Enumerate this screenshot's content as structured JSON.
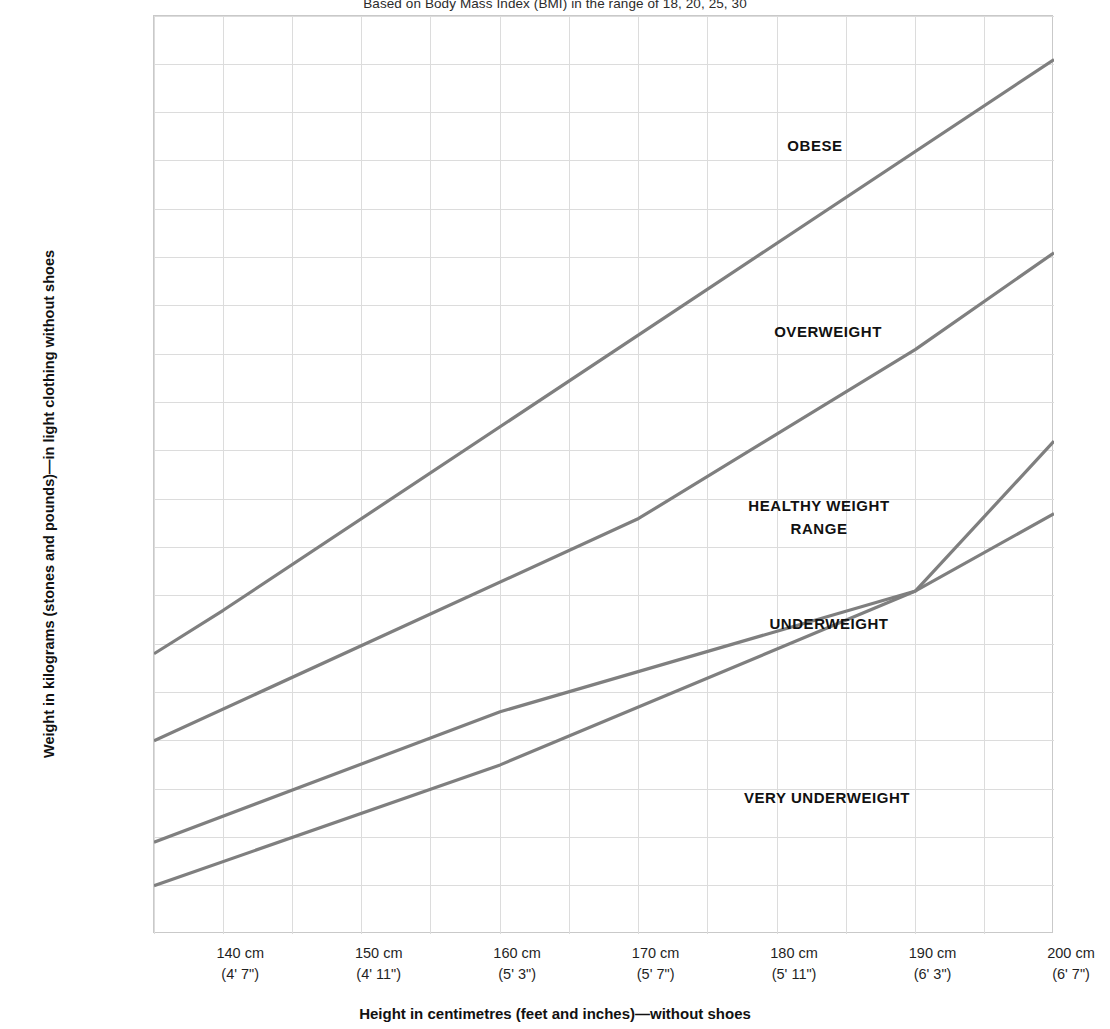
{
  "chart_data": {
    "type": "line",
    "title": "Based on Body Mass Index (BMI) in the range of 18, 20, 25, 30",
    "xlabel": "Height in centimetres (feet and inches)—without shoes",
    "ylabel": "Weight in kilograms (stones and pounds)—in light clothing without shoes",
    "xlim": [
      135,
      200
    ],
    "ylim": [
      30,
      125
    ],
    "grid": true,
    "legend_position": "inline-zone-labels",
    "x_unit": "cm",
    "y_unit": "kg",
    "y_secondary_unit": "st/lb",
    "x_ticks": [
      {
        "cm": "140 cm",
        "ft": "(4' 7\")",
        "value": 140
      },
      {
        "cm": "150 cm",
        "ft": "(4' 11\")",
        "value": 150
      },
      {
        "cm": "160 cm",
        "ft": "(5' 3\")",
        "value": 160
      },
      {
        "cm": "170 cm",
        "ft": "(5' 7\")",
        "value": 170
      },
      {
        "cm": "180 cm",
        "ft": "(5' 11\")",
        "value": 180
      },
      {
        "cm": "190 cm",
        "ft": "(6' 3\")",
        "value": 190
      },
      {
        "cm": "200 cm",
        "ft": "(6' 7\")",
        "value": 200
      }
    ],
    "x_minor_gridlines": [
      135,
      140,
      145,
      150,
      155,
      160,
      165,
      170,
      175,
      180,
      185,
      190,
      195,
      200
    ],
    "y_ticks": [
      {
        "kg": "120",
        "st": "(18.12)",
        "value": 120
      },
      {
        "kg": "110",
        "st": "(17.4)",
        "value": 110
      },
      {
        "kg": "100",
        "st": "(15.10)",
        "value": 100
      },
      {
        "kg": "90",
        "st": "(14.2)",
        "value": 90
      },
      {
        "kg": "80",
        "st": "(12.8)",
        "value": 80
      },
      {
        "kg": "70",
        "st": "(11.0)",
        "value": 70
      },
      {
        "kg": "60",
        "st": "(9.6)",
        "value": 60
      },
      {
        "kg": "50",
        "st": "(7.12)",
        "value": 50
      },
      {
        "kg": "40",
        "st": "(6.4)",
        "value": 40
      },
      {
        "kg": "30",
        "st": "(4.10)",
        "value": 30
      }
    ],
    "y_minor_gridlines": [
      30,
      35,
      40,
      45,
      50,
      55,
      60,
      65,
      70,
      75,
      80,
      85,
      90,
      95,
      100,
      105,
      110,
      115,
      120,
      125
    ],
    "y_axis_corner_labels": {
      "left": "(st/lb)",
      "right": "kg"
    },
    "line_color": "#7f7f7f",
    "grid_color": "#dcdcdc",
    "series": [
      {
        "name": "BMI 30",
        "boundary": "overweight / obese",
        "points": [
          {
            "x": 135,
            "y": 59.0
          },
          {
            "x": 140,
            "y": 63.5
          },
          {
            "x": 200,
            "y": 120.5
          }
        ]
      },
      {
        "name": "BMI 25",
        "boundary": "healthy weight / overweight",
        "points": [
          {
            "x": 135,
            "y": 50.0
          },
          {
            "x": 170,
            "y": 73.0
          },
          {
            "x": 190,
            "y": 90.5
          },
          {
            "x": 200,
            "y": 100.5
          }
        ]
      },
      {
        "name": "BMI 20",
        "boundary": "underweight / healthy weight",
        "points": [
          {
            "x": 135,
            "y": 39.5
          },
          {
            "x": 160,
            "y": 53.0
          },
          {
            "x": 190,
            "y": 65.5
          },
          {
            "x": 200,
            "y": 81.0
          }
        ]
      },
      {
        "name": "BMI 18",
        "boundary": "very underweight / underweight",
        "points": [
          {
            "x": 135,
            "y": 35.0
          },
          {
            "x": 160,
            "y": 47.5
          },
          {
            "x": 190,
            "y": 65.5
          },
          {
            "x": 200,
            "y": 73.5
          }
        ]
      }
    ],
    "zone_labels": [
      {
        "text": "OBESE",
        "x": 815,
        "y": 146
      },
      {
        "text": "OVERWEIGHT",
        "x": 828,
        "y": 332
      },
      {
        "text": "HEALTHY WEIGHT\nRANGE",
        "x": 819,
        "y": 517
      },
      {
        "text": "UNDERWEIGHT",
        "x": 829,
        "y": 624
      },
      {
        "text": "VERY UNDERWEIGHT",
        "x": 827,
        "y": 798
      }
    ]
  }
}
